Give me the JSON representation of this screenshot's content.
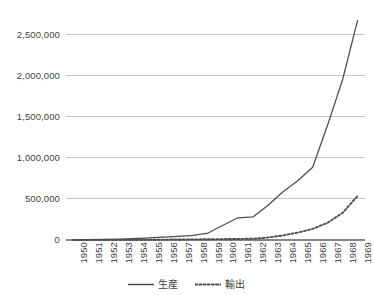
{
  "chart_data": {
    "type": "line",
    "title": "",
    "xlabel": "",
    "ylabel": "",
    "x": [
      1950,
      1951,
      1952,
      1953,
      1954,
      1955,
      1956,
      1957,
      1958,
      1959,
      1960,
      1961,
      1962,
      1963,
      1964,
      1965,
      1966,
      1967,
      1968,
      1969
    ],
    "categories": [
      "1950",
      "1951",
      "1952",
      "1953",
      "1954",
      "1955",
      "1956",
      "1957",
      "1958",
      "1959",
      "1960",
      "1961",
      "1962",
      "1963",
      "1964",
      "1965",
      "1966",
      "1967",
      "1968",
      "1969"
    ],
    "series": [
      {
        "name": "生産",
        "style": "solid",
        "color": "#4d4d4d",
        "values": [
          3000,
          5000,
          8000,
          12000,
          18000,
          26000,
          35000,
          45000,
          57000,
          85000,
          180000,
          270000,
          280000,
          420000,
          585000,
          720000,
          885000,
          1400000,
          1950000,
          2670000
        ]
      },
      {
        "name": "輸出",
        "style": "dotted",
        "color": "#4d4d4d",
        "values": [
          500,
          800,
          1200,
          1800,
          2500,
          3500,
          4500,
          6000,
          7500,
          9000,
          11000,
          13000,
          16000,
          30000,
          55000,
          90000,
          135000,
          210000,
          330000,
          535000
        ]
      }
    ],
    "ylim": [
      0,
      2750000
    ],
    "yticks": [
      0,
      500000,
      1000000,
      1500000,
      2000000,
      2500000
    ],
    "ytick_labels": [
      "0",
      "500,000",
      "1,000,000",
      "1,500,000",
      "2,000,000",
      "2,500,000"
    ],
    "grid": "horizontal",
    "gridline_color": "#bfbfbf",
    "axis_color": "#868686",
    "legend_position": "bottom",
    "legend": [
      "生産",
      "輸出"
    ],
    "background": "#ffffff"
  }
}
